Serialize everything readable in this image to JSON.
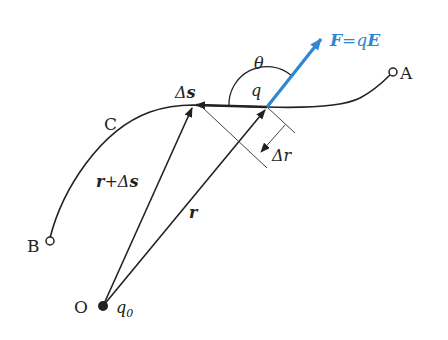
{
  "diagram": {
    "colors": {
      "line": "#222222",
      "force": "#2f86d1",
      "background": "#ffffff"
    },
    "labels": {
      "point_a": "A",
      "point_b": "B",
      "point_o": "O",
      "curve": "C",
      "source_charge": "q",
      "source_charge_sub": "0",
      "test_charge": "q",
      "angle": "θ",
      "force_F": "F",
      "force_eq": "=",
      "force_q": "q",
      "force_E": "E",
      "delta_s_sym": "Δ",
      "delta_s_var": "s",
      "delta_r_sym": "Δ",
      "delta_r_var": "r",
      "r_plus": "r",
      "plus": "+",
      "r_plus_delta": "Δ",
      "r_plus_s": "s",
      "r_vec": "r"
    }
  }
}
